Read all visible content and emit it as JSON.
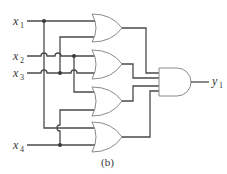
{
  "diagram": {
    "type": "logic-circuit",
    "caption": "(b)",
    "inputs": [
      {
        "name": "x",
        "sub": "1"
      },
      {
        "name": "x",
        "sub": "2"
      },
      {
        "name": "x",
        "sub": "3"
      },
      {
        "name": "x",
        "sub": "4"
      }
    ],
    "outputs": [
      {
        "name": "y",
        "sub": "1"
      }
    ],
    "gates": [
      {
        "id": "or1",
        "type": "OR",
        "inputs": [
          "x1",
          "x3"
        ]
      },
      {
        "id": "or2",
        "type": "OR",
        "inputs": [
          "x2",
          "x3"
        ]
      },
      {
        "id": "or3",
        "type": "OR",
        "inputs": [
          "x2",
          "x4"
        ]
      },
      {
        "id": "or4",
        "type": "OR",
        "inputs": [
          "x1",
          "x4"
        ]
      },
      {
        "id": "and1",
        "type": "AND",
        "inputs": [
          "or1",
          "or2",
          "or3",
          "or4"
        ],
        "output": "y1"
      }
    ],
    "colors": {
      "wire": "#4a4a4a",
      "gate_outline": "#8a8a8a",
      "text": "#333333"
    }
  }
}
